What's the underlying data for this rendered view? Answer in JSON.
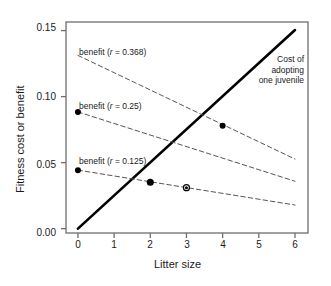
{
  "chart_data": {
    "type": "line",
    "title": "",
    "xlabel": "Litter size",
    "ylabel": "Fitness cost or benefit",
    "xlim": [
      -0.33,
      6.36
    ],
    "ylim": [
      -0.0033,
      0.1565
    ],
    "xticks": [
      0,
      1,
      2,
      3,
      4,
      5,
      6
    ],
    "xticklabels": [
      "0",
      "1",
      "2",
      "3",
      "4",
      "5",
      "6"
    ],
    "yticks": [
      0.0,
      0.05,
      0.1,
      0.15
    ],
    "yticklabels": [
      "0.00",
      "0.05",
      "0.10",
      "0.15"
    ],
    "grid": false,
    "legend": "none (inline annotations)",
    "series": [
      {
        "name": "Cost of adopting one juvenile",
        "style": "solid",
        "color": "#000000",
        "linewidth": 2.6,
        "x": [
          0,
          6
        ],
        "y": [
          0.0,
          0.1504
        ]
      },
      {
        "name": "benefit (r = 0.368)",
        "r": 0.368,
        "style": "dashed",
        "color": "#555555",
        "linewidth": 1,
        "x": [
          0,
          6
        ],
        "y": [
          0.1312,
          0.0527
        ]
      },
      {
        "name": "benefit (r = 0.25)",
        "r": 0.25,
        "style": "dashed",
        "color": "#555555",
        "linewidth": 1,
        "x": [
          0,
          6
        ],
        "y": [
          0.0884,
          0.0359
        ]
      },
      {
        "name": "benefit (r = 0.125)",
        "r": 0.125,
        "style": "dashed",
        "color": "#555555",
        "linewidth": 1,
        "x": [
          0,
          6
        ],
        "y": [
          0.0443,
          0.0179
        ]
      }
    ],
    "points": [
      {
        "x": 0,
        "y": 0.0884,
        "marker": "filled-circle",
        "size": 6
      },
      {
        "x": 0,
        "y": 0.0443,
        "marker": "filled-circle",
        "size": 6
      },
      {
        "x": 2,
        "y": 0.0352,
        "marker": "filled-circle",
        "size": 7
      },
      {
        "x": 3,
        "y": 0.031,
        "marker": "open-circle-dot",
        "size": 6
      },
      {
        "x": 4,
        "y": 0.078,
        "marker": "filled-circle",
        "size": 6
      }
    ],
    "annotations": [
      {
        "name": "benefit-0368-label",
        "text": "benefit (r = 0.368)",
        "x": 0.1,
        "y": 0.1405
      },
      {
        "name": "benefit-025-label",
        "text": "benefit (r = 0.25)",
        "x": 0.1,
        "y": 0.0975
      },
      {
        "name": "benefit-0125-label",
        "text": "benefit (r = 0.125)",
        "x": 0.1,
        "y": 0.0532
      },
      {
        "name": "cost-annotation",
        "lines": [
          "Cost of",
          "adopting",
          "one juvenile"
        ],
        "x": 6.25,
        "y": 0.1385
      }
    ]
  },
  "labels": {
    "benefit_368": "benefit (",
    "benefit_368_r": "r",
    "benefit_368_tail": " = 0.368)",
    "benefit_25": "benefit (",
    "benefit_25_r": "r",
    "benefit_25_tail": " = 0.25)",
    "benefit_125": "benefit (",
    "benefit_125_r": "r",
    "benefit_125_tail": " = 0.125)",
    "cost_line1": "Cost of",
    "cost_line2": "adopting",
    "cost_line3": "one juvenile",
    "xaxis_title": "Litter size",
    "yaxis_title": "Fitness cost or benefit",
    "xt0": "0",
    "xt1": "1",
    "xt2": "2",
    "xt3": "3",
    "xt4": "4",
    "xt5": "5",
    "xt6": "6",
    "yt0": "0.00",
    "yt1": "0.05",
    "yt2": "0.10",
    "yt3": "0.15"
  },
  "colors": {
    "frame": "#6e6e6e",
    "cost_line": "#000000",
    "benefit_line": "#555555",
    "text": "#1a1a1a",
    "background": "#ffffff"
  }
}
